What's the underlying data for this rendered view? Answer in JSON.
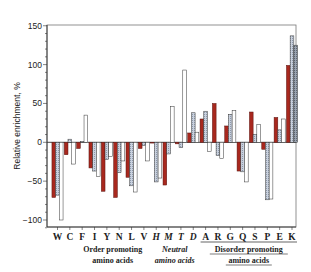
{
  "chart_data": {
    "type": "bar",
    "title": "",
    "xlabel": "",
    "ylabel": "Relative enrichment, %",
    "ylim": [
      -110,
      150
    ],
    "yticks": [
      150,
      100,
      50,
      0,
      -50,
      -100
    ],
    "grid": false,
    "legend": null,
    "categories": [
      "W",
      "C",
      "F",
      "I",
      "Y",
      "N",
      "L",
      "V",
      "H",
      "M",
      "T",
      "D",
      "A",
      "R",
      "G",
      "Q",
      "S",
      "P",
      "E",
      "K"
    ],
    "italic_categories": [
      "H",
      "M",
      "T",
      "D"
    ],
    "underlined_categories": [
      "A",
      "R",
      "G",
      "Q",
      "S",
      "P",
      "E",
      "K"
    ],
    "series": [
      {
        "name": "series-1",
        "style": "solid",
        "color": "#a8281e",
        "values": [
          -71,
          -16,
          -8,
          -33,
          -63,
          -71,
          -45,
          -8,
          -1,
          -55,
          -2,
          12,
          30,
          50,
          21,
          -37,
          39,
          -9,
          32,
          99
        ]
      },
      {
        "name": "series-2",
        "style": "hatched",
        "color": "#b9c3d3",
        "values": [
          -68,
          4,
          1,
          -37,
          -22,
          -39,
          -56,
          -4,
          -51,
          -15,
          -7,
          38,
          40,
          -17,
          36,
          -38,
          10,
          -74,
          16,
          137
        ]
      },
      {
        "name": "series-3",
        "style": "open",
        "color": "#ffffff",
        "values": [
          -100,
          -28,
          35,
          -44,
          -18,
          -24,
          -64,
          -24,
          -46,
          46,
          93,
          13,
          -12,
          -21,
          41,
          -51,
          23,
          -73,
          30,
          125
        ]
      }
    ],
    "group_annotations": [
      {
        "label_line1": "Order promoting",
        "label_line2": "amino acids",
        "from": "W",
        "to": "V",
        "style": "bold"
      },
      {
        "label_line1": "Neutral",
        "label_line2": "amino acids",
        "from": "H",
        "to": "D",
        "style": "italic"
      },
      {
        "label_line1": "Disorder promoting",
        "label_line2": "amino acids",
        "from": "A",
        "to": "K",
        "style": "underline"
      }
    ]
  }
}
